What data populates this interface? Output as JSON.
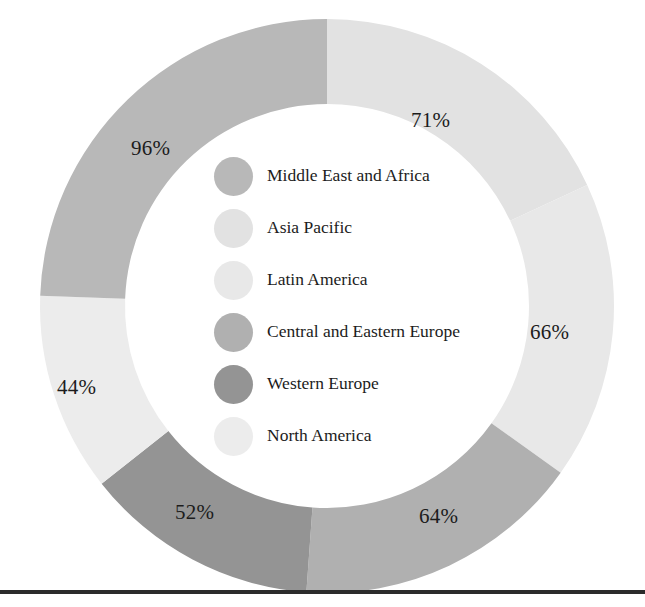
{
  "chart_data": {
    "type": "pie",
    "variant": "donut",
    "title": "",
    "subtitle": "",
    "xlabel": "",
    "ylabel": "",
    "grid": false,
    "legend_position": "center",
    "start_angle_deg": 0,
    "direction": "clockwise",
    "value_suffix": "%",
    "categories": [
      "Asia Pacific",
      "Latin America",
      "Central and Eastern Europe",
      "Western Europe",
      "North America",
      "Middle East and Africa"
    ],
    "values": [
      71,
      66,
      64,
      52,
      44,
      96
    ],
    "labels": [
      "71%",
      "66%",
      "64%",
      "52%",
      "44%",
      "96%"
    ],
    "colors": [
      "#e2e2e2",
      "#e8e8e8",
      "#b0b0b0",
      "#949494",
      "#ececec",
      "#b8b8b8"
    ],
    "total": 393,
    "slices": [
      {
        "name": "Asia Pacific",
        "value": 71,
        "label": "71%",
        "color": "#e2e2e2"
      },
      {
        "name": "Latin America",
        "value": 66,
        "label": "66%",
        "color": "#e8e8e8"
      },
      {
        "name": "Central and Eastern Europe",
        "value": 64,
        "label": "64%",
        "color": "#b0b0b0"
      },
      {
        "name": "Western Europe",
        "value": 52,
        "label": "52%",
        "color": "#949494"
      },
      {
        "name": "North America",
        "value": 44,
        "label": "44%",
        "color": "#ececec"
      },
      {
        "name": "Middle East and Africa",
        "value": 96,
        "label": "96%",
        "color": "#b8b8b8"
      }
    ]
  },
  "legend": {
    "items": [
      {
        "label": "Middle East and Africa",
        "color": "#b8b8b8"
      },
      {
        "label": "Asia Pacific",
        "color": "#e2e2e2"
      },
      {
        "label": "Latin America",
        "color": "#e8e8e8"
      },
      {
        "label": "Central and Eastern Europe",
        "color": "#b0b0b0"
      },
      {
        "label": "Western Europe",
        "color": "#949494"
      },
      {
        "label": "North America",
        "color": "#ececec"
      }
    ]
  },
  "callouts": [
    {
      "text": "71%",
      "x": 411,
      "y": 110
    },
    {
      "text": "96%",
      "x": 131,
      "y": 138
    },
    {
      "text": "66%",
      "x": 530,
      "y": 322
    },
    {
      "text": "44%",
      "x": 57,
      "y": 377
    },
    {
      "text": "52%",
      "x": 175,
      "y": 502
    },
    {
      "text": "64%",
      "x": 419,
      "y": 506
    }
  ],
  "colors": {
    "background": "#ffffff",
    "text": "#1c1c1c",
    "rule": "#2b2b2b",
    "donut_hole": "#ffffff"
  }
}
